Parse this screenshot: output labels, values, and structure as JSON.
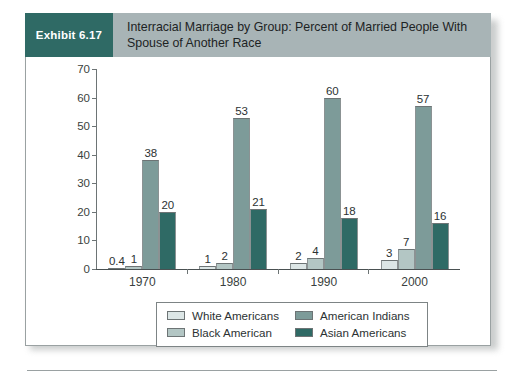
{
  "exhibit": {
    "badge_label": "Exhibit 6.17",
    "title": "Interracial Marriage by Group: Percent of Married People With Spouse of Another Race"
  },
  "colors": {
    "badge_bg": "#2f6a65",
    "header_bg": "#a8b4b6",
    "panel_bg": "#ffffff",
    "panel_border": "#9aa1a2",
    "white_americans": "#dce6e6",
    "black_american": "#b3c6c4",
    "american_indians": "#7d9b99",
    "asian_americans": "#2f6a65",
    "axis": "#6d7475",
    "text": "#2c3233"
  },
  "chart_data": {
    "type": "bar",
    "title": "Interracial Marriage by Group: Percent of Married People With Spouse of Another Race",
    "xlabel": "",
    "ylabel": "",
    "ylim": [
      0,
      70
    ],
    "yticks": [
      0,
      10,
      20,
      30,
      40,
      50,
      60,
      70
    ],
    "grid": false,
    "legend_position": "bottom",
    "categories": [
      "1970",
      "1980",
      "1990",
      "2000"
    ],
    "series": [
      {
        "name": "White Americans",
        "color": "#dce6e6",
        "values": [
          0.4,
          1,
          2,
          3
        ],
        "labels": [
          "0.4",
          "1",
          "2",
          "3"
        ]
      },
      {
        "name": "Black American",
        "color": "#b3c6c4",
        "values": [
          1,
          2,
          4,
          7
        ],
        "labels": [
          "1",
          "2",
          "4",
          "7"
        ]
      },
      {
        "name": "American Indians",
        "color": "#7d9b99",
        "values": [
          38,
          53,
          60,
          57
        ],
        "labels": [
          "38",
          "53",
          "60",
          "57"
        ]
      },
      {
        "name": "Asian Americans",
        "color": "#2f6a65",
        "values": [
          20,
          21,
          18,
          16
        ],
        "labels": [
          "20",
          "21",
          "18",
          "16"
        ]
      }
    ]
  }
}
